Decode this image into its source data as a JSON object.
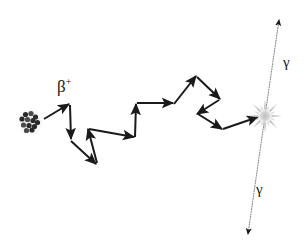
{
  "figure": {
    "width": 308,
    "height": 249,
    "background_color": "#ffffff",
    "track_color": "#1a1a1a",
    "gamma_line_color": "#8c8c8c",
    "gamma_arrow_color": "#1a1a1a",
    "nucleus_color": "#2b2b2b",
    "nucleus_halo_color": "#e8e8e8",
    "annihilation_color": "#c9c9c9"
  },
  "labels": {
    "positron": "β",
    "positron_charge": "+",
    "gamma_top": "γ",
    "gamma_bottom": "γ"
  },
  "nucleus": {
    "name": "radionuclide-nucleus",
    "center_x": 30,
    "center_y": 122,
    "halo_radius": 16,
    "nucleon_radius": 2.6,
    "nucleons": [
      [
        25.5,
        114.5
      ],
      [
        31.0,
        113.5
      ],
      [
        35.5,
        117.0
      ],
      [
        22.0,
        119.0
      ],
      [
        27.5,
        119.5
      ],
      [
        33.0,
        120.5
      ],
      [
        37.5,
        122.5
      ],
      [
        23.5,
        125.0
      ],
      [
        29.0,
        125.5
      ],
      [
        34.5,
        126.5
      ],
      [
        26.5,
        130.5
      ],
      [
        32.0,
        130.0
      ]
    ]
  },
  "positron_track": {
    "name": "positron-zigzag-track",
    "description": "Positron scattering path from nucleus to annihilation point",
    "segments": [
      {
        "x1": 44,
        "y1": 119,
        "x2": 69,
        "y2": 104
      },
      {
        "x1": 70,
        "y1": 105,
        "x2": 71,
        "y2": 139
      },
      {
        "x1": 71,
        "y1": 141,
        "x2": 96,
        "y2": 164
      },
      {
        "x1": 97,
        "y1": 163,
        "x2": 88,
        "y2": 129
      },
      {
        "x1": 89,
        "y1": 129,
        "x2": 134,
        "y2": 137
      },
      {
        "x1": 135,
        "y1": 137,
        "x2": 136,
        "y2": 104
      },
      {
        "x1": 137,
        "y1": 103,
        "x2": 173,
        "y2": 103
      },
      {
        "x1": 174,
        "y1": 104,
        "x2": 196,
        "y2": 76
      },
      {
        "x1": 197,
        "y1": 77,
        "x2": 220,
        "y2": 99
      },
      {
        "x1": 219,
        "y1": 100,
        "x2": 197,
        "y2": 114
      },
      {
        "x1": 198,
        "y1": 114,
        "x2": 222,
        "y2": 129
      },
      {
        "x1": 223,
        "y1": 129,
        "x2": 258,
        "y2": 117
      }
    ],
    "arrow_head_length": 8,
    "arrow_head_width": 6,
    "line_width": 2
  },
  "annihilation": {
    "name": "annihilation-event",
    "center_x": 265,
    "center_y": 116,
    "core_radius": 7,
    "spike_outer": 17,
    "spike_count": 8
  },
  "gamma_rays": [
    {
      "name": "gamma-ray-up",
      "x1": 265,
      "y1": 116,
      "x2": 279,
      "y2": 20,
      "direction": "up-right",
      "style": "dotted"
    },
    {
      "name": "gamma-ray-down",
      "x1": 265,
      "y1": 116,
      "x2": 248,
      "y2": 234,
      "direction": "down-left",
      "style": "dotted"
    }
  ],
  "gamma_line_extent": {
    "x1": 280,
    "y1": 14,
    "x2": 247,
    "y2": 240
  }
}
